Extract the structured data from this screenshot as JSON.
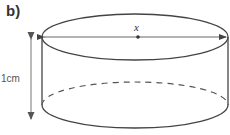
{
  "part_label": "b)",
  "diameter_label": "x",
  "height_label": "1cm",
  "figure": {
    "shape": "cylinder",
    "annotations": [
      "diameter across top marked x with centre point",
      "height arrow labelled 1cm",
      "hidden back edge of base shown dashed"
    ]
  },
  "colors": {
    "stroke": "#444444",
    "arrow": "#777777"
  }
}
